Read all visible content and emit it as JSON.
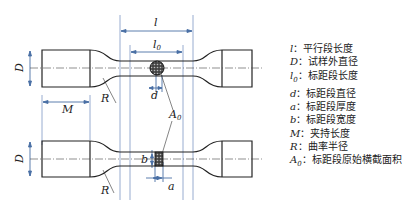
{
  "diagram": {
    "labels": {
      "l": "l",
      "l0": "l",
      "l0_sub": "0",
      "D_top": "D",
      "D_bottom": "D",
      "d": "d",
      "M": "M",
      "R_top": "R",
      "R_bottom": "R",
      "A0": "A",
      "A0_sub": "0",
      "a": "a",
      "b": "b"
    },
    "colors": {
      "outline": "#222222",
      "dimension": "#4a6fa5",
      "hatch": "#333333"
    }
  },
  "legend": {
    "items": [
      {
        "symbol": "l",
        "sub": "",
        "text": "平行段长度"
      },
      {
        "symbol": "D",
        "sub": "",
        "text": "试样外直径"
      },
      {
        "symbol": "l",
        "sub": "0",
        "text": "标距段长度"
      },
      {
        "symbol": "d",
        "sub": "",
        "text": "标距段直径"
      },
      {
        "symbol": "a",
        "sub": "",
        "text": "标距段厚度"
      },
      {
        "symbol": "b",
        "sub": "",
        "text": "标距段宽度"
      },
      {
        "symbol": "M",
        "sub": "",
        "text": "夹持长度"
      },
      {
        "symbol": "R",
        "sub": "",
        "text": "曲率半径"
      },
      {
        "symbol": "A",
        "sub": "0",
        "text": "标距段原始横截面积"
      }
    ],
    "separator": "："
  }
}
